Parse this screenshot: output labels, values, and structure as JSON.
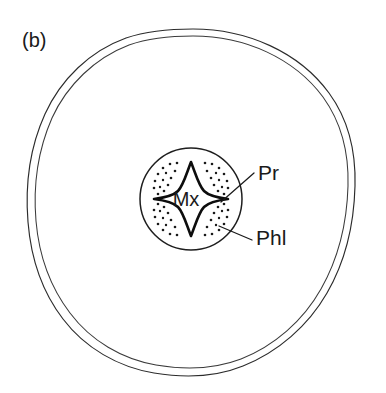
{
  "figure": {
    "panel_label": "(b)",
    "background_color": "#ffffff",
    "line_color": "#1a1a1a"
  },
  "annotations": {
    "maturexylem": {
      "text": "Mx",
      "meaning": "metaxylem",
      "x": 186,
      "y": 206
    },
    "protoxylem": {
      "text": "Pr",
      "meaning": "protoxylem",
      "x": 258,
      "y": 180
    },
    "phloem": {
      "text": "Phl",
      "meaning": "phloem",
      "x": 256,
      "y": 245
    }
  },
  "structures": {
    "epidermis": {
      "name": "epidermis-outer-boundary",
      "center_x": 191,
      "center_y": 202,
      "radius_x": 164,
      "radius_y": 173
    },
    "cortex_inner_line": {
      "name": "cortex-inner-boundary",
      "center_x": 191,
      "center_y": 202,
      "radius_x": 158,
      "radius_y": 167
    },
    "stele": {
      "name": "stele-boundary",
      "center_x": 191,
      "center_y": 199,
      "radius": 51
    },
    "xylem_star": {
      "name": "tetrarch-xylem",
      "arms": 4,
      "center_x": 191,
      "center_y": 199,
      "outer_radius": 38,
      "inner_radius": 16
    },
    "phloem_patches": {
      "name": "phloem-dotted-regions",
      "count": 4,
      "positions": [
        "upper-left",
        "upper-right",
        "lower-left",
        "lower-right"
      ]
    }
  },
  "leader_lines": {
    "protoxylem_leader": {
      "from_x": 223,
      "from_y": 200,
      "to_x": 254,
      "to_y": 173
    },
    "phloem_leader": {
      "from_x": 220,
      "from_y": 225,
      "to_x": 254,
      "to_y": 240
    }
  },
  "colors": {
    "ink": "#1a1a1a",
    "outline": "#2b2b2b",
    "paper": "#ffffff"
  }
}
